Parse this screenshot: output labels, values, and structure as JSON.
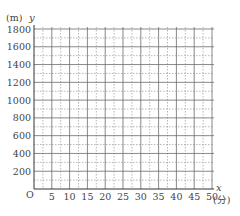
{
  "chart_data": {
    "type": "line",
    "title": "",
    "xlabel": "x",
    "xunit": "(分)",
    "ylabel": "y",
    "yunit": "(m)",
    "origin_label": "O",
    "xlim": [
      0,
      50
    ],
    "ylim": [
      0,
      1800
    ],
    "x_ticks": [
      5,
      10,
      15,
      20,
      25,
      30,
      35,
      40,
      45,
      50
    ],
    "y_ticks": [
      200,
      400,
      600,
      800,
      1000,
      1200,
      1400,
      1600,
      1800
    ],
    "x_major_step": 5,
    "x_minor_step": 2.5,
    "y_major_step": 200,
    "y_minor_step": 100,
    "grid": true,
    "series": []
  },
  "colors": {
    "major_grid": "#6b6b6b",
    "minor_grid": "#9a9a9a",
    "axis": "#333333",
    "text": "#444444"
  }
}
